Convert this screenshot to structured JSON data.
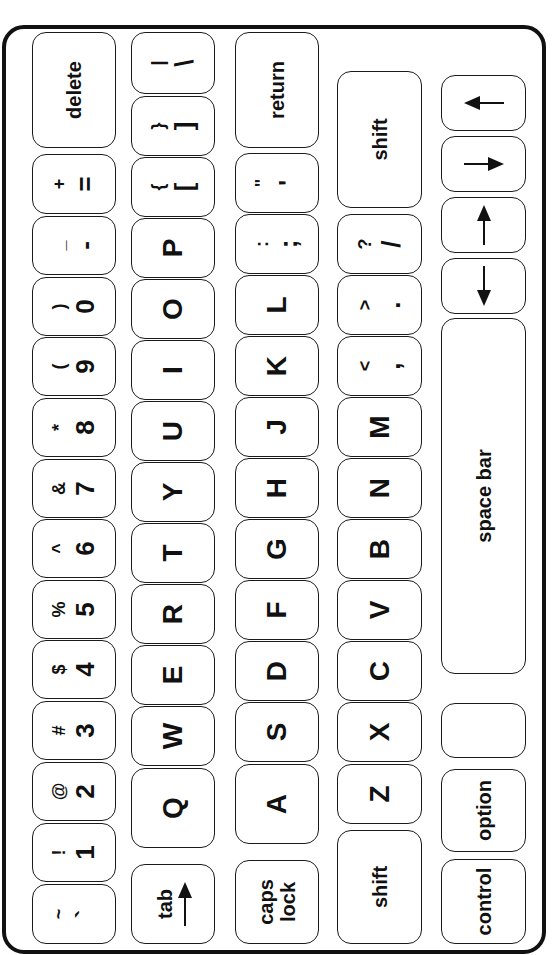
{
  "keyboard": {
    "row1": [
      {
        "top": "~",
        "bot": "`"
      },
      {
        "top": "!",
        "bot": "1"
      },
      {
        "top": "@",
        "bot": "2"
      },
      {
        "top": "#",
        "bot": "3"
      },
      {
        "top": "$",
        "bot": "4"
      },
      {
        "top": "%",
        "bot": "5"
      },
      {
        "top": "^",
        "bot": "6"
      },
      {
        "top": "&",
        "bot": "7"
      },
      {
        "top": "*",
        "bot": "8"
      },
      {
        "top": "(",
        "bot": "9"
      },
      {
        "top": ")",
        "bot": "0"
      },
      {
        "top": "_",
        "bot": "-"
      },
      {
        "top": "+",
        "bot": "="
      },
      {
        "label": "delete"
      }
    ],
    "row2": {
      "tab": "tab",
      "tab_icon": "arrow-right",
      "letters": [
        "Q",
        "W",
        "E",
        "R",
        "T",
        "Y",
        "U",
        "I",
        "O",
        "P"
      ],
      "brackets": [
        {
          "top": "{",
          "bot": "["
        },
        {
          "top": "}",
          "bot": "]"
        },
        {
          "top": "|",
          "bot": "\\"
        }
      ]
    },
    "row3": {
      "caps_lock": "caps lock",
      "letters": [
        "A",
        "S",
        "D",
        "F",
        "G",
        "H",
        "J",
        "K",
        "L"
      ],
      "punct": [
        {
          "top": ":",
          "bot": ";"
        },
        {
          "top": "\"",
          "bot": "'"
        }
      ],
      "return": "return"
    },
    "row4": {
      "shift_left": "shift",
      "letters": [
        "Z",
        "X",
        "C",
        "V",
        "B",
        "N",
        "M"
      ],
      "punct": [
        {
          "top": "<",
          "bot": ","
        },
        {
          "top": ">",
          "bot": "."
        },
        {
          "top": "?",
          "bot": "/"
        }
      ],
      "shift_right": "shift"
    },
    "row5": {
      "control": "control",
      "option": "option",
      "blank1": "",
      "blank2": "",
      "space_bar": "space bar",
      "arrows": {
        "down": "↓",
        "up": "↑",
        "right": "→",
        "left": "←"
      }
    }
  }
}
